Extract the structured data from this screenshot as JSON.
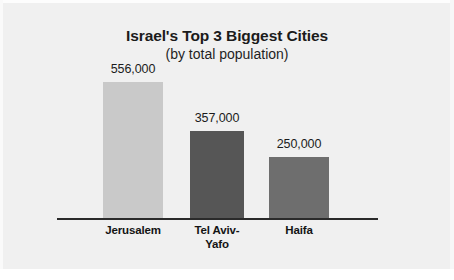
{
  "chart_data": {
    "type": "bar",
    "title": "Israel's Top 3 Biggest Cities",
    "subtitle": "(by total population)",
    "xlabel": "",
    "ylabel": "",
    "ylim": [
      0,
      640000
    ],
    "grid": false,
    "legend": "none",
    "axis_line": "baseline only",
    "categories": [
      "Jerusalem",
      "Tel Aviv-Yafo",
      "Haifa"
    ],
    "values": [
      556000,
      357000,
      250000
    ],
    "value_labels": [
      "556,000",
      "357,000",
      "250,000"
    ],
    "bar_colors": [
      "#c9c9c9",
      "#565656",
      "#6e6e6e"
    ],
    "background_color": "#f0f0f0",
    "text_color": "#1b1b1b",
    "axis_color": "#2a2a2a"
  },
  "bars": [
    {
      "label": "Jerusalem",
      "label_line1": "Jerusalem",
      "label_line2": "",
      "value": 556000,
      "value_label": "556,000",
      "color": "#c9c9c9"
    },
    {
      "label": "Tel Aviv-Yafo",
      "label_line1": "Tel Aviv-",
      "label_line2": "Yafo",
      "value": 357000,
      "value_label": "357,000",
      "color": "#565656"
    },
    {
      "label": "Haifa",
      "label_line1": "Haifa",
      "label_line2": "",
      "value": 250000,
      "value_label": "250,000",
      "color": "#6e6e6e"
    }
  ]
}
